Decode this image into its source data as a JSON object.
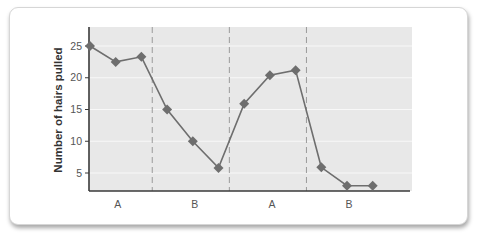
{
  "chart_data": {
    "type": "line",
    "title": "",
    "xlabel": "",
    "ylabel": "Number of hairs pulled",
    "ylim": [
      2.2,
      28
    ],
    "yticks": [
      5,
      10,
      15,
      20,
      25
    ],
    "grid": "horizontal",
    "legend": "none",
    "phases": [
      {
        "label": "A",
        "points": [
          1,
          2,
          3
        ]
      },
      {
        "label": "B",
        "points": [
          4,
          5,
          6
        ]
      },
      {
        "label": "A",
        "points": [
          7,
          8,
          9
        ]
      },
      {
        "label": "B",
        "points": [
          10,
          11,
          12
        ]
      }
    ],
    "x": [
      1,
      2,
      3,
      4,
      5,
      6,
      7,
      8,
      9,
      10,
      11,
      12
    ],
    "series": [
      {
        "name": "Hairs pulled",
        "values": [
          25,
          22.5,
          23.3,
          15,
          10,
          5.8,
          15.9,
          20.4,
          21.2,
          5.9,
          3,
          3
        ]
      }
    ]
  },
  "colors": {
    "plot_bg": "#e8e8e8",
    "gridline": "#f8f8f8",
    "series": "#6e6e6e",
    "axis": "#3a3a3a",
    "divider": "#9a9a9a"
  }
}
